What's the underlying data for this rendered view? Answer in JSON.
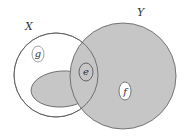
{
  "diagram": {
    "type": "venn-set-diagram",
    "colors": {
      "background": "#ffffff",
      "fill": "#c6c6c6",
      "stroke": "#5a5a5a",
      "text": "#333333"
    },
    "sets": {
      "x": {
        "label": "X"
      },
      "y": {
        "label": "Y"
      }
    },
    "elements": {
      "g": {
        "label": "g"
      },
      "e": {
        "label": "e"
      },
      "f": {
        "label": "f"
      }
    }
  }
}
